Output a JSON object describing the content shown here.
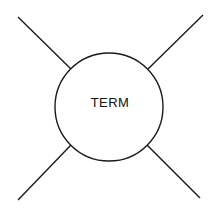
{
  "diagram": {
    "background_color": "#ffffff",
    "stroke_color": "#1a1a1a",
    "text_color": "#111111",
    "node": {
      "label": "TERM",
      "shape": "circle",
      "center_x": 109,
      "center_y": 107,
      "radius": 54,
      "fill_color": "#ffffff",
      "stroke_width": 1.4
    },
    "connectors": [
      {
        "name": "top-left",
        "x1": 71,
        "y1": 69,
        "x2": 18,
        "y2": 17
      },
      {
        "name": "top-right",
        "x1": 148,
        "y1": 69,
        "x2": 203,
        "y2": 15
      },
      {
        "name": "bottom-left",
        "x1": 71,
        "y1": 145,
        "x2": 18,
        "y2": 200
      },
      {
        "name": "bottom-right",
        "x1": 147,
        "y1": 145,
        "x2": 200,
        "y2": 198
      }
    ]
  }
}
